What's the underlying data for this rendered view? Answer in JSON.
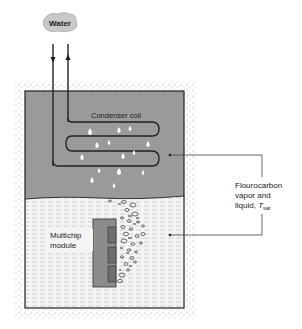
{
  "source_label": "Water",
  "coil_label": "Condenser coil",
  "module_label_line1": "Multichip",
  "module_label_line2": "module",
  "fluid_label_line1": "Flourocarbon",
  "fluid_label_line2": "vapor and",
  "fluid_label_line3": "liquid, ",
  "fluid_label_symbol": "T",
  "fluid_label_subscript": "sat",
  "colors": {
    "vapor": "#9a9a9a",
    "liquid": "#f2f2f2",
    "module": "#8c8c8c",
    "chip": "#6e6e6e",
    "lines": "#222222",
    "cloud": "#c8c8c8"
  }
}
